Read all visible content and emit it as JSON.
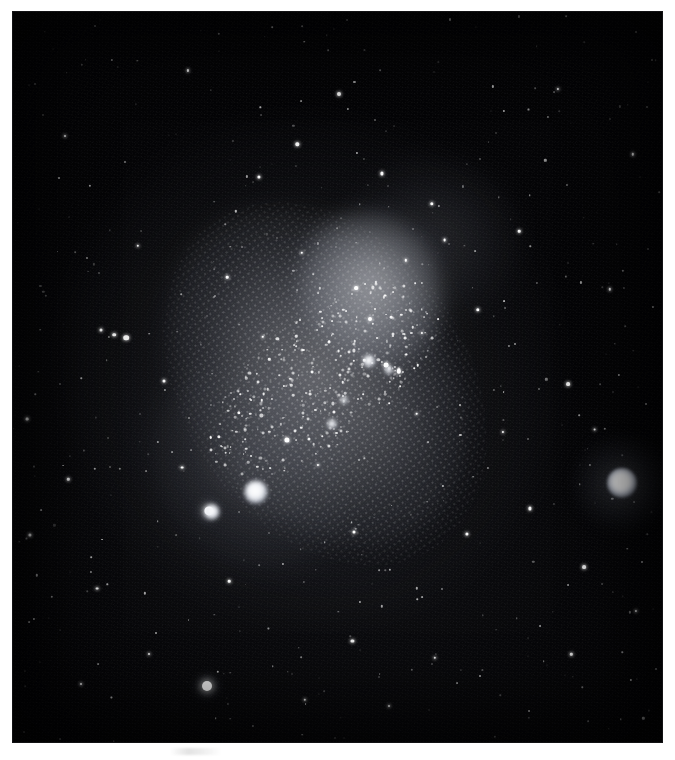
{
  "image": {
    "kind": "astronomical-photograph",
    "medium": "monochrome photographic plate",
    "alt_text": "Monochrome astronomical plate showing an irregular galaxy, the Small Magellanic Cloud, elongated from upper right to lower left, with a bright resolved star cloud near its centre, two bright nebulous knots at lower left of the galaxy body, and a very bright compact globular cluster at the right edge of the field.",
    "background_color": "#050507",
    "page_color": "#ffffff",
    "frame": {
      "left": 13,
      "top": 12,
      "width": 649,
      "height": 730
    }
  },
  "caption": {
    "text": ""
  },
  "field": {
    "galaxy": {
      "name": "Small Magellanic Cloud",
      "tilt_degrees": -34
    },
    "cluster": {
      "name": "47 Tucanae",
      "position": {
        "x_pct": 93.8,
        "y_pct": 64.5
      },
      "core_diameter_px": 30,
      "halo_diameter_px": 96,
      "brightness": "very bright"
    },
    "knots": [
      {
        "name": "bright-knot-large",
        "x_pct": 37.5,
        "y_pct": 65.8,
        "d": 23
      },
      {
        "name": "bright-knot-small",
        "x_pct": 30.6,
        "y_pct": 68.5,
        "d": 15
      },
      {
        "name": "bright-knot-core",
        "x_pct": 54.8,
        "y_pct": 47.8,
        "d": 12
      },
      {
        "name": "knot-core-b",
        "x_pct": 58.0,
        "y_pct": 49.0,
        "d": 8
      },
      {
        "name": "knot-core-c",
        "x_pct": 51.0,
        "y_pct": 53.2,
        "d": 7
      },
      {
        "name": "knot-core-d",
        "x_pct": 49.2,
        "y_pct": 56.4,
        "d": 9
      }
    ],
    "bright_stars": [
      {
        "x_pct": 29.9,
        "y_pct": 92.3,
        "r": 5.0,
        "glow": "glow-m"
      },
      {
        "x_pct": 30.2,
        "y_pct": 68.3,
        "r": 4.6,
        "glow": "glow-m"
      },
      {
        "x_pct": 17.4,
        "y_pct": 44.6,
        "r": 2.8,
        "glow": "glow-s"
      },
      {
        "x_pct": 15.6,
        "y_pct": 44.2,
        "r": 1.8,
        "glow": "glow-s"
      },
      {
        "x_pct": 13.6,
        "y_pct": 43.6,
        "r": 1.5,
        "glow": "glow-s"
      },
      {
        "x_pct": 42.2,
        "y_pct": 58.6,
        "r": 2.6,
        "glow": "glow-s"
      },
      {
        "x_pct": 57.5,
        "y_pct": 48.4,
        "r": 2.4,
        "glow": "glow-s"
      },
      {
        "x_pct": 59.4,
        "y_pct": 49.2,
        "r": 2.2,
        "glow": "glow-s"
      },
      {
        "x_pct": 55.0,
        "y_pct": 42.1,
        "r": 2.0,
        "glow": "glow-s"
      },
      {
        "x_pct": 52.9,
        "y_pct": 37.8,
        "r": 1.9,
        "glow": "glow-s"
      },
      {
        "x_pct": 50.3,
        "y_pct": 11.3,
        "r": 2.0,
        "glow": "glow-s"
      },
      {
        "x_pct": 43.8,
        "y_pct": 18.1,
        "r": 1.7,
        "glow": "glow-s"
      },
      {
        "x_pct": 37.9,
        "y_pct": 22.6,
        "r": 1.6,
        "glow": "glow-s"
      },
      {
        "x_pct": 56.8,
        "y_pct": 22.1,
        "r": 1.6,
        "glow": "glow-s"
      },
      {
        "x_pct": 64.5,
        "y_pct": 26.3,
        "r": 1.7,
        "glow": "glow-s"
      },
      {
        "x_pct": 71.6,
        "y_pct": 40.8,
        "r": 1.7,
        "glow": "glow-s"
      },
      {
        "x_pct": 85.5,
        "y_pct": 51.0,
        "r": 1.9,
        "glow": "glow-s"
      },
      {
        "x_pct": 88.0,
        "y_pct": 76.0,
        "r": 1.9,
        "glow": "glow-s"
      },
      {
        "x_pct": 89.6,
        "y_pct": 57.2,
        "r": 1.4,
        "glow": "glow-s"
      },
      {
        "x_pct": 79.6,
        "y_pct": 68.0,
        "r": 1.6,
        "glow": "glow-s"
      },
      {
        "x_pct": 70.0,
        "y_pct": 71.5,
        "r": 1.6,
        "glow": "glow-s"
      },
      {
        "x_pct": 52.5,
        "y_pct": 71.3,
        "r": 1.5,
        "glow": "glow-s"
      },
      {
        "x_pct": 52.3,
        "y_pct": 86.2,
        "r": 1.6,
        "glow": "glow-s"
      },
      {
        "x_pct": 2.6,
        "y_pct": 71.6,
        "r": 1.6,
        "glow": "glow-s"
      },
      {
        "x_pct": 2.2,
        "y_pct": 55.8,
        "r": 1.4,
        "glow": "glow-s"
      },
      {
        "x_pct": 13.0,
        "y_pct": 79.0,
        "r": 1.4,
        "glow": "glow-s"
      },
      {
        "x_pct": 33.3,
        "y_pct": 78.0,
        "r": 1.3,
        "glow": "glow-s"
      },
      {
        "x_pct": 26.0,
        "y_pct": 62.4,
        "r": 1.4,
        "glow": "glow-s"
      },
      {
        "x_pct": 23.3,
        "y_pct": 50.5,
        "r": 1.5,
        "glow": "glow-s"
      },
      {
        "x_pct": 62.2,
        "y_pct": 55.0,
        "r": 1.3,
        "glow": "glow-s"
      },
      {
        "x_pct": 33.0,
        "y_pct": 36.3,
        "r": 1.3,
        "glow": "glow-s"
      },
      {
        "x_pct": 19.2,
        "y_pct": 32.0,
        "r": 1.2,
        "glow": "glow-s"
      },
      {
        "x_pct": 66.5,
        "y_pct": 31.3,
        "r": 1.4,
        "glow": "glow-s"
      },
      {
        "x_pct": 78.0,
        "y_pct": 30.0,
        "r": 1.3,
        "glow": "glow-s"
      },
      {
        "x_pct": 8.5,
        "y_pct": 64.0,
        "r": 1.2,
        "glow": "glow-s"
      },
      {
        "x_pct": 45.0,
        "y_pct": 94.2,
        "r": 1.2,
        "glow": "glow-s"
      },
      {
        "x_pct": 65.0,
        "y_pct": 88.5,
        "r": 1.2,
        "glow": "glow-s"
      },
      {
        "x_pct": 86.0,
        "y_pct": 88.0,
        "r": 1.2,
        "glow": "glow-s"
      },
      {
        "x_pct": 92.0,
        "y_pct": 38.0,
        "r": 1.2,
        "glow": "glow-s"
      },
      {
        "x_pct": 95.5,
        "y_pct": 19.5,
        "r": 1.2,
        "glow": "glow-s"
      },
      {
        "x_pct": 84.0,
        "y_pct": 10.5,
        "r": 1.1,
        "glow": "glow-s"
      },
      {
        "x_pct": 27.0,
        "y_pct": 8.0,
        "r": 1.1,
        "glow": "glow-s"
      },
      {
        "x_pct": 8.0,
        "y_pct": 17.0,
        "r": 1.0,
        "glow": "glow-s"
      },
      {
        "x_pct": 96.0,
        "y_pct": 82.0,
        "r": 1.1,
        "glow": "glow-s"
      },
      {
        "x_pct": 75.5,
        "y_pct": 57.5,
        "r": 1.1,
        "glow": "glow-s"
      },
      {
        "x_pct": 38.5,
        "y_pct": 44.5,
        "r": 1.2,
        "glow": "glow-s"
      },
      {
        "x_pct": 44.5,
        "y_pct": 33.0,
        "r": 1.2,
        "glow": "glow-s"
      },
      {
        "x_pct": 60.5,
        "y_pct": 34.0,
        "r": 1.2,
        "glow": "glow-s"
      },
      {
        "x_pct": 63.0,
        "y_pct": 44.0,
        "r": 1.1,
        "glow": "glow-s"
      },
      {
        "x_pct": 47.0,
        "y_pct": 62.0,
        "r": 1.1,
        "glow": "glow-s"
      },
      {
        "x_pct": 21.0,
        "y_pct": 88.0,
        "r": 1.0,
        "glow": "glow-s"
      },
      {
        "x_pct": 58.0,
        "y_pct": 95.0,
        "r": 1.0,
        "glow": "glow-s"
      },
      {
        "x_pct": 10.5,
        "y_pct": 92.0,
        "r": 1.0,
        "glow": "glow-s"
      }
    ]
  }
}
